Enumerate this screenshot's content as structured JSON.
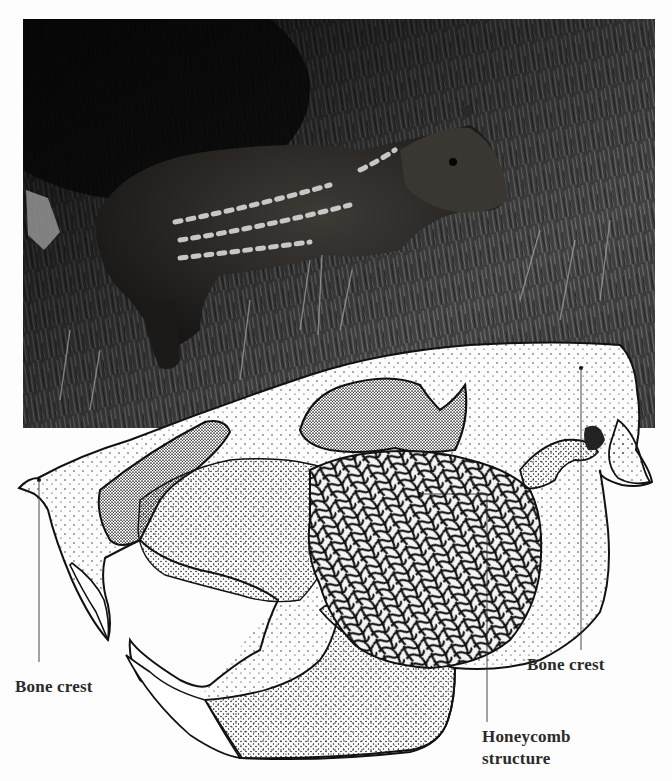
{
  "figure": {
    "photo": {
      "subject": "young striped paca standing in grass",
      "style": "black-and-white photograph",
      "bounds": {
        "x": 23,
        "y": 19,
        "width": 632,
        "height": 409
      }
    },
    "illustration": {
      "subject": "stippled skull drawing, lateral view, showing enlarged cheek chamber",
      "style": "pen-and-ink stipple"
    },
    "labels": [
      {
        "id": "bone-crest-left",
        "text": "Bone crest",
        "pointer": {
          "dot": [
            39,
            480
          ],
          "line_end": [
            39,
            662
          ]
        }
      },
      {
        "id": "bone-crest-right",
        "text": "Bone crest",
        "pointer": {
          "dot": [
            581,
            368
          ],
          "line_end": [
            581,
            650
          ]
        }
      },
      {
        "id": "honeycomb",
        "text_line1": "Honeycomb",
        "text_line2": "structure",
        "pointer": {
          "dot": [
            420,
            494
          ],
          "elbow": [
            487,
            494
          ],
          "line_end": [
            487,
            722
          ]
        }
      }
    ]
  },
  "colors": {
    "background": "#fdfdfd",
    "ink": "#111111",
    "label": "#2a2a2a",
    "photo_dark": "#0e0e0e",
    "photo_grass": "#6e6e6e"
  }
}
